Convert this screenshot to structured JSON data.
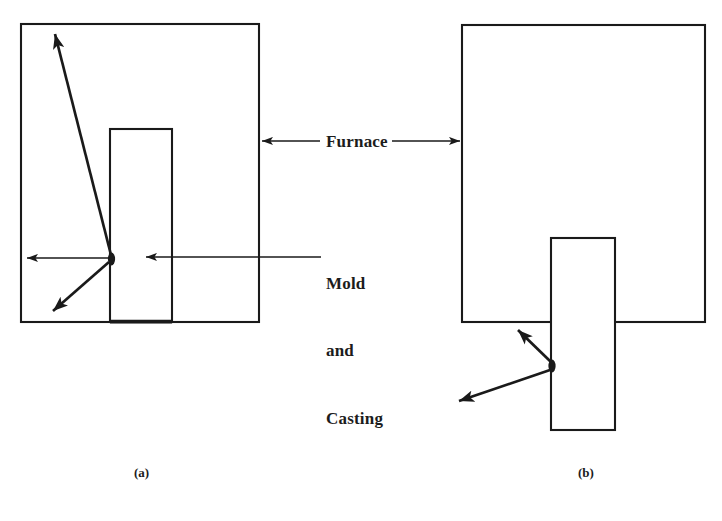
{
  "figure": {
    "background": "#ffffff",
    "ink": "#1a1a1a",
    "labels": {
      "furnace": "Furnace",
      "mold_line1": "Mold",
      "mold_line2": "and",
      "mold_line3": "Casting"
    },
    "captions": {
      "a": "(a)",
      "b": "(b)"
    },
    "panels": [
      {
        "id": "a",
        "caption": "(a)",
        "furnace_box": {
          "x": 21,
          "y": 24,
          "width": 238,
          "height": 298
        },
        "mold_box": {
          "x": 110,
          "y": 129,
          "width": 62,
          "height": 193
        },
        "source_dot": {
          "x": 111,
          "y": 259,
          "rx": 3.5,
          "ry": 6
        },
        "rays": [
          {
            "name": "ray-up-left",
            "x1": 111,
            "y1": 255,
            "x2": 54,
            "y2": 33,
            "weight": "thick"
          },
          {
            "name": "ray-left",
            "x1": 109,
            "y1": 258,
            "x2": 26,
            "y2": 258,
            "weight": "thin"
          },
          {
            "name": "ray-down-left",
            "x1": 109,
            "y1": 263,
            "x2": 52,
            "y2": 312,
            "weight": "thick"
          }
        ]
      },
      {
        "id": "b",
        "caption": "(b)",
        "furnace_box": {
          "x": 462,
          "y": 25,
          "width": 243,
          "height": 297
        },
        "mold_box": {
          "x": 551,
          "y": 238,
          "width": 64,
          "height": 192
        },
        "source_dot": {
          "x": 552,
          "y": 366,
          "rx": 3.5,
          "ry": 6
        },
        "rays": [
          {
            "name": "ray-up-left",
            "x1": 551,
            "y1": 362,
            "x2": 517,
            "y2": 329,
            "weight": "thick"
          },
          {
            "name": "ray-down-left",
            "x1": 550,
            "y1": 370,
            "x2": 458,
            "y2": 402,
            "weight": "thick"
          }
        ]
      }
    ],
    "furnace_pointer_left": {
      "x1": 320,
      "y1": 141,
      "x2": 261,
      "y2": 141
    },
    "furnace_pointer_right": {
      "x1": 392,
      "y1": 141,
      "x2": 461,
      "y2": 141
    },
    "mold_pointer": {
      "x1": 321,
      "y1": 257,
      "x2": 145,
      "y2": 257
    }
  }
}
